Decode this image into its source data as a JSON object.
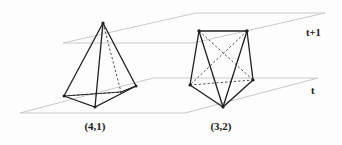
{
  "figure": {
    "background_color": "#fdfdfd",
    "planes": [
      {
        "id": "upper",
        "label": "t+1",
        "color": "#c9c9c9",
        "corners": [
          [
            63,
            43
          ],
          [
            196,
            13
          ],
          [
            325,
            13
          ],
          [
            193,
            43
          ]
        ]
      },
      {
        "id": "lower",
        "label": "t",
        "color": "#c9c9c9",
        "corners": [
          [
            20,
            113
          ],
          [
            153,
            78
          ],
          [
            318,
            78
          ],
          [
            185,
            113
          ]
        ]
      }
    ],
    "labels": {
      "upper_plane": "t+1",
      "lower_plane": "t"
    },
    "shapes": [
      {
        "id": "square-pyramid",
        "caption": "(4,1)",
        "description": "square pyramid with 4 base vertices on plane t and 1 apex vertex on plane t+1",
        "base_count": 4,
        "apex_count": 1,
        "edge_color": "#1f1f1f",
        "hidden_edge_style": "dashed"
      },
      {
        "id": "triangular-prism-like",
        "caption": "(3,2)",
        "description": "polyhedron with 3 vertices on plane t and 2 vertices on plane t+1",
        "base_count": 3,
        "apex_count": 2,
        "edge_color": "#1f1f1f",
        "hidden_edge_style": "dashed"
      }
    ],
    "captions": {
      "left": "(4,1)",
      "right": "(3,2)"
    },
    "colors": {
      "plane_line": "#c9c9c9",
      "solid_edge": "#1f1f1f",
      "dashed_edge": "#4a4a4a",
      "text": "#1a1a1a"
    }
  }
}
